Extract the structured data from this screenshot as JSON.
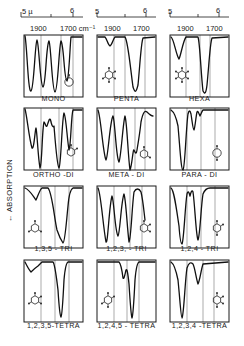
{
  "figure": {
    "y_axis_label": "← ABSORPTION",
    "top_axes": [
      {
        "micron_start": "5 µ",
        "micron_end": "6",
        "wn_left": "1900",
        "wn_right": "1700 cm⁻¹"
      },
      {
        "micron_start": "5",
        "micron_end": "6",
        "wn_left": "1900",
        "wn_right": "1700"
      },
      {
        "micron_start": "5",
        "micron_end": "6",
        "wn_left": "1900",
        "wn_right": "1700"
      }
    ],
    "panels": [
      {
        "label": "MONO",
        "ring": "mono",
        "curve": "M1,1 C3,10 4,58 7,56 C10,54 11,8 13,5 C15,8 16,50 19,52 C22,50 22,10 25,6 C27,10 28,56 31,57 C34,56 35,10 37,6 C40,10 40,45 43,46 C45,44 46,10 47,2 L58,2"
      },
      {
        "label": "PENTA",
        "ring": "penta",
        "curve": "M1,2 L8,2 C10,4 11,10 13,11 C15,10 16,4 18,2 L28,2 C31,6 33,30 36,52 C38,58 39,58 41,50 C43,30 44,8 46,3 L58,2"
      },
      {
        "label": "HEXA",
        "ring": "hexa",
        "curve": "M1,2 C4,4 6,20 9,24 C11,20 13,6 16,2 L28,2 C30,8 31,40 33,56 C35,60 36,58 37,50 C39,30 40,8 42,3 L58,2"
      },
      {
        "label": "ORTHO -DI",
        "ring": "ortho",
        "curve": "M1,1 C3,8 5,30 8,40 C10,42 11,22 12,20 C13,22 14,50 16,60 C18,58 18,22 20,14 C21,14 22,20 23,18 C25,12 26,8 27,14 C28,18 29,20 30,18 C31,30 33,58 35,60 C37,58 38,10 40,5 C42,8 43,30 45,42 C47,38 47,8 49,2 L58,2"
      },
      {
        "label": "META - DI",
        "ring": "meta",
        "curve": "M1,2 C4,10 6,46 9,52 C11,50 13,12 16,8 C18,12 19,50 22,54 C24,50 26,14 28,8 C30,14 31,48 33,62 C35,58 36,40 37,42 C38,44 39,48 40,42 C42,30 43,24 44,14 C46,4 48,2 50,4 C52,6 54,8 56,8"
      },
      {
        "label": "PARA - DI",
        "ring": "para",
        "curve": "M1,2 C4,4 6,8 8,18 C10,40 11,62 13,62 C15,60 16,20 18,6 C19,2 20,2 21,6 C22,12 23,22 24,22 C25,20 26,8 27,4 C28,2 29,6 30,8 C31,6 32,3 33,2 L58,2"
      },
      {
        "label": "1,3,5 - TRI",
        "ring": "tri135",
        "curve": "M1,2 C6,4 9,10 12,14 C14,10 16,3 18,2 L24,2 C28,6 30,30 33,44 C35,50 37,54 39,57 C41,56 42,40 44,20 C45,8 47,3 49,2 L58,2"
      },
      {
        "label": "1,2,3, - TRI",
        "ring": "tri123",
        "curve": "M1,2 C4,8 6,40 9,56 C11,58 12,20 15,10 C17,14 18,46 21,50 C23,48 24,16 27,8 C29,14 30,40 32,56 C34,54 35,20 37,6 C39,2 42,2 44,6 C46,14 47,26 48,34"
      },
      {
        "label": "1,2,4 - TRI",
        "ring": "tri124",
        "curve": "M1,2 C4,4 6,20 9,40 C10,54 11,58 12,58 C14,54 15,20 17,8 C18,4 19,6 20,10 C21,6 22,3 23,6 C25,20 26,50 28,54 C30,50 31,20 33,8 C35,3 37,2 40,2 L58,2"
      },
      {
        "label": "1,2,3,5-TETRA",
        "ring": "tetra1235",
        "curve": "M1,2 C3,6 5,10 7,12 C9,10 11,8 14,6 C16,4 17,3 18,2 L29,2 C31,4 32,14 34,30 C35,46 36,56 37,57 C38,56 39,40 40,20 C41,8 42,3 44,2 L58,2"
      },
      {
        "label": "1,2,4,5 - TETRA",
        "ring": "tetra1245",
        "curve": "M1,2 L22,2 C24,4 25,10 26,18 C27,20 28,14 29,10 C30,8 31,14 32,24 C33,40 34,56 35,58 C36,56 37,40 38,20 C39,8 40,3 42,2 L58,2"
      },
      {
        "label": "1,2,3,4 -TETRA",
        "ring": "tetra1234",
        "curve": "M1,2 C4,4 6,10 8,20 C10,40 11,58 12,58 C14,54 15,20 17,8 C19,2 21,2 23,4 C25,8 26,18 28,24 C30,20 31,10 33,4 L58,2"
      }
    ]
  }
}
